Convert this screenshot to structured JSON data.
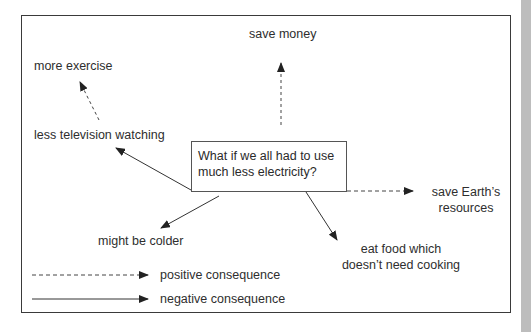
{
  "diagram": {
    "question": {
      "line1": "What if we all had to use",
      "line2": "much less electricity?"
    },
    "nodes": [
      {
        "id": "save-money",
        "text": "save money",
        "type": "positive"
      },
      {
        "id": "more-exercise",
        "text": "more exercise",
        "type": "positive"
      },
      {
        "id": "less-tv",
        "text": "less television watching",
        "type": "negative"
      },
      {
        "id": "save-resources",
        "line1": "save Earth’s",
        "line2": "resources",
        "type": "positive"
      },
      {
        "id": "might-be-colder",
        "text": "might be colder",
        "type": "negative"
      },
      {
        "id": "eat-food",
        "line1": "eat food which",
        "line2": "doesn’t need cooking",
        "type": "negative"
      }
    ],
    "legend": {
      "positive": "positive consequence",
      "negative": "negative consequence"
    },
    "colors": {
      "line": "#333333",
      "frame": "#3a3a3a",
      "strip": "#bdbdbd"
    }
  }
}
